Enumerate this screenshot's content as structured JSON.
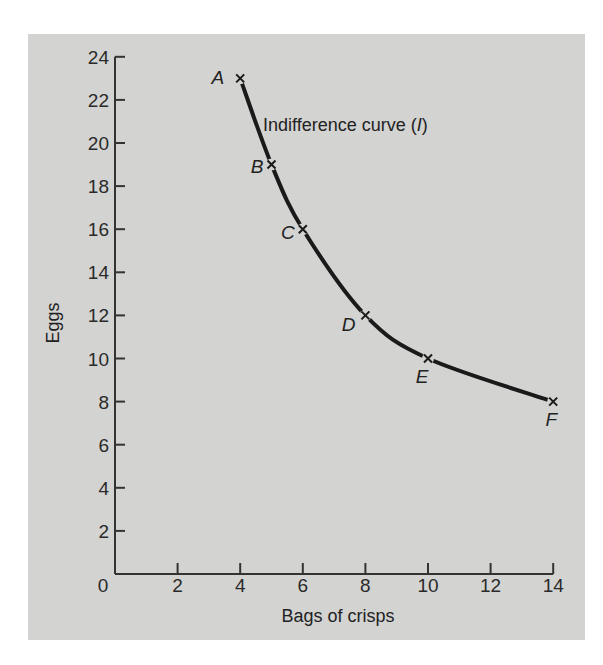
{
  "chart_data": {
    "type": "line",
    "title": "",
    "xlabel": "Bags of crisps",
    "ylabel": "Eggs",
    "xlim": [
      0,
      14
    ],
    "ylim": [
      0,
      24
    ],
    "x_ticks": [
      0,
      2,
      4,
      6,
      8,
      10,
      12,
      14
    ],
    "y_ticks": [
      2,
      4,
      6,
      8,
      10,
      12,
      14,
      16,
      18,
      20,
      22,
      24
    ],
    "grid": false,
    "legend": null,
    "series": [
      {
        "name": "Indifference curve (I)",
        "points": [
          {
            "label": "A",
            "x": 4,
            "y": 23
          },
          {
            "label": "B",
            "x": 5,
            "y": 19
          },
          {
            "label": "C",
            "x": 6,
            "y": 16
          },
          {
            "label": "D",
            "x": 8,
            "y": 12
          },
          {
            "label": "E",
            "x": 10,
            "y": 10
          },
          {
            "label": "F",
            "x": 14,
            "y": 8
          }
        ]
      }
    ],
    "annotations": [
      {
        "text": "Indifference curve (",
        "italic_part": "I",
        "suffix": ")",
        "x": 5.0,
        "y": 21.2
      }
    ]
  },
  "labels": {
    "xlabel": "Bags of crisps",
    "ylabel": "Eggs",
    "origin": "0",
    "curve_prefix": "Indifference curve (",
    "curve_italic": "I",
    "curve_suffix": ")"
  },
  "colors": {
    "background": "#d3d3d1",
    "page": "#ffffff",
    "ink": "#1a1a1a"
  }
}
